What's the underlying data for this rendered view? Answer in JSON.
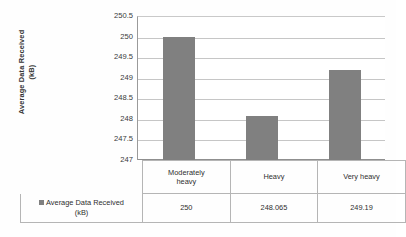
{
  "chart_data": {
    "type": "bar",
    "title": "",
    "xlabel": "",
    "ylabel": "Average Data Received\n(kB)",
    "categories": [
      "Moderately\nheavy",
      "Heavy",
      "Very heavy"
    ],
    "values": [
      250,
      248.065,
      249.19
    ],
    "series": [
      {
        "name": "Average Data Received (kB)",
        "values": [
          250,
          248.065,
          249.19
        ]
      }
    ],
    "value_labels": [
      "250",
      "248.065",
      "249.19"
    ],
    "ylim": [
      247,
      250.5
    ],
    "yticks": [
      250.5,
      250,
      249.5,
      249,
      248.5,
      248,
      247.5,
      247
    ],
    "ytick_labels": [
      "250.5",
      "250",
      "249.5",
      "249",
      "248.5",
      "248",
      "247.5",
      "247"
    ],
    "grid": true,
    "legend_position": "data-table",
    "bar_color": "#808080",
    "gridline_color": "#c6c6c6",
    "axis_color": "#8f8f8f",
    "background": "#ffffff"
  },
  "legend": {
    "series_label": "Average Data Received (kB)",
    "series_label_line1": "Average Data Received",
    "series_label_line2": "(kB)",
    "swatch_color": "#808080",
    "swatch_icon": "square-swatch-icon"
  },
  "data_table": {
    "categories": [
      "Moderately\nheavy",
      "Heavy",
      "Very heavy"
    ],
    "values": [
      "250",
      "248.065",
      "249.19"
    ]
  },
  "axis": {
    "y_title_line1": "Average Data Received",
    "y_title_line2": "(kB)",
    "y_title": "Average Data Received\n(kB)",
    "ticks": [
      "250.5",
      "250",
      "249.5",
      "249",
      "248.5",
      "248",
      "247.5",
      "247"
    ]
  }
}
